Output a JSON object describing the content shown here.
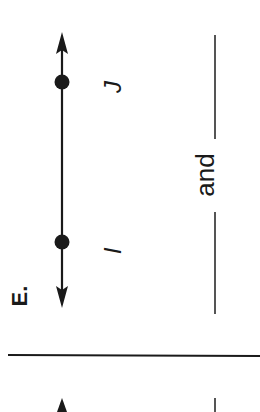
{
  "problem": {
    "label": "E.",
    "points": [
      {
        "name": "J"
      },
      {
        "name": "I"
      }
    ],
    "answer_prompt": {
      "connector": "and",
      "blank_count": 2
    }
  },
  "colors": {
    "ink": "#1a1a1a",
    "blank_line": "#555555",
    "background": "#ffffff"
  }
}
